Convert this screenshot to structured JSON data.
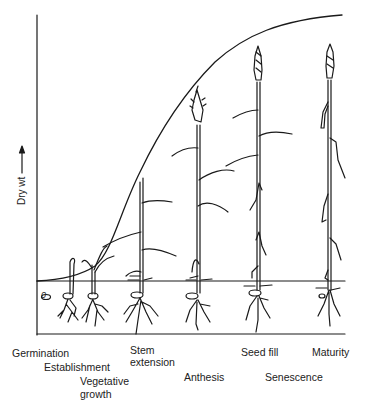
{
  "diagram": {
    "title": "",
    "y_axis": {
      "label": "Dry wt",
      "arrow": "up"
    },
    "soil_marker": "0",
    "stages": [
      {
        "id": "germination",
        "label": "Germination"
      },
      {
        "id": "establishment",
        "label": "Establishment"
      },
      {
        "id": "vegetative",
        "label": "Vegetative",
        "label2": "growth"
      },
      {
        "id": "stem-extension",
        "label": "Stem",
        "label2": "extension"
      },
      {
        "id": "anthesis",
        "label": "Anthesis"
      },
      {
        "id": "seed-fill",
        "label": "Seed fill"
      },
      {
        "id": "senescence",
        "label": "Senescence"
      },
      {
        "id": "maturity",
        "label": "Maturity"
      }
    ],
    "curve": {
      "description": "Sigmoid dry weight accumulation curve",
      "points": [
        [
          37,
          281
        ],
        [
          70,
          278
        ],
        [
          95,
          268
        ],
        [
          110,
          245
        ],
        [
          125,
          200
        ],
        [
          145,
          155
        ],
        [
          170,
          110
        ],
        [
          200,
          72
        ],
        [
          235,
          44
        ],
        [
          270,
          28
        ],
        [
          305,
          19
        ],
        [
          342,
          15
        ]
      ]
    },
    "colors": {
      "line": "#1a1a1a",
      "background": "#ffffff"
    }
  }
}
